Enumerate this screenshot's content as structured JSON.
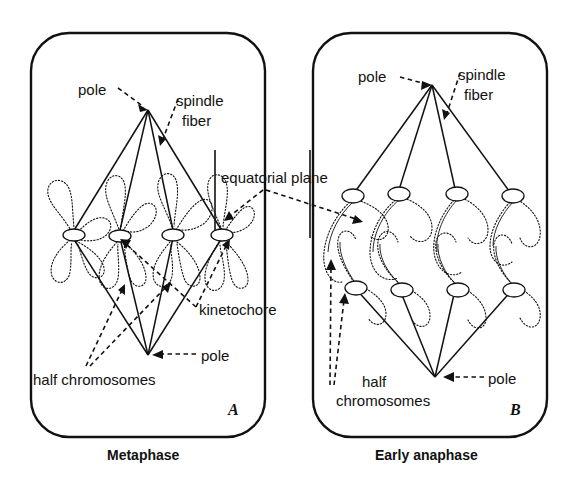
{
  "figure": {
    "style": "line drawing, black ink on white"
  },
  "panels": [
    {
      "id": "A",
      "letter": "A",
      "caption": "Metaphase",
      "labels": {
        "pole_top": "pole",
        "spindle_fiber": "spindle\nfiber",
        "spindle_fiber_line1": "spindle",
        "spindle_fiber_line2": "fiber",
        "kinetochore": "kinetochore",
        "half_chromosomes": "half chromosomes",
        "pole_bottom": "pole"
      },
      "chromosome_count": 4,
      "chromosomes_aligned": true
    },
    {
      "id": "B",
      "letter": "B",
      "caption": "Early anaphase",
      "labels": {
        "pole_top": "pole",
        "spindle_fiber_line1": "spindle",
        "spindle_fiber_line2": "fiber",
        "half_chromosomes_line1": "half",
        "half_chromosomes_line2": "chromosomes",
        "pole_bottom": "pole"
      },
      "chromosome_count": 4,
      "chromosomes_aligned": false
    }
  ],
  "shared_labels": {
    "equatorial_plane": "equatorial plane"
  },
  "colors": {
    "ink": "#111111",
    "paper": "#ffffff"
  }
}
